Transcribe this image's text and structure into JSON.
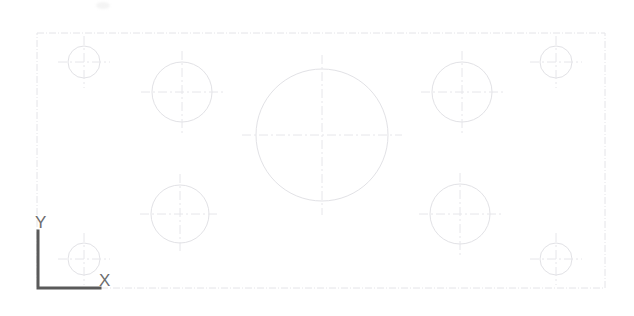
{
  "viewport": {
    "width": 634,
    "height": 316,
    "background_color": "#ffffff",
    "title": "CAD part outline with bolt-hole pattern"
  },
  "colors": {
    "geometry_line": "#e2e2e6",
    "centerline": "#e6e6ea",
    "border_line": "#e4e4e8",
    "ucs_icon": "#5a5a5a",
    "ucs_label": "#6d6d6d",
    "background": "#ffffff"
  },
  "ucs_icon": {
    "name": "ucs-coordinate-icon",
    "origin_x": 38,
    "origin_y": 288,
    "y_arm_top": 231,
    "x_arm_right": 100,
    "stroke_width": 3,
    "y_label": "Y",
    "x_label": "X"
  },
  "part_outline": {
    "name": "rectangular-plate-outline",
    "x": 37,
    "y": 33,
    "width": 568,
    "height": 255,
    "stroke_width": 1
  },
  "chart_data": {
    "type": "scatter",
    "xlabel": "X",
    "ylabel": "Y",
    "xlim": [
      37,
      605
    ],
    "ylim": [
      33,
      288
    ],
    "grid": false,
    "legend": "none",
    "annotations": [
      "Y",
      "X"
    ],
    "series": [
      {
        "name": "corner-holes-small",
        "radius": 16,
        "values": [
          {
            "label": "hole-top-left",
            "cx": 84,
            "cy": 62,
            "r": 16
          },
          {
            "label": "hole-top-right",
            "cx": 556,
            "cy": 62,
            "r": 16
          },
          {
            "label": "hole-bottom-left",
            "cx": 84,
            "cy": 259,
            "r": 16
          },
          {
            "label": "hole-bottom-right",
            "cx": 556,
            "cy": 259,
            "r": 16
          }
        ]
      },
      {
        "name": "intermediate-holes-medium",
        "radius": 30,
        "values": [
          {
            "label": "hole-upper-left",
            "cx": 182,
            "cy": 92,
            "r": 30
          },
          {
            "label": "hole-upper-right",
            "cx": 462,
            "cy": 92,
            "r": 30
          },
          {
            "label": "hole-lower-left",
            "cx": 180,
            "cy": 214,
            "r": 29
          },
          {
            "label": "hole-lower-right",
            "cx": 460,
            "cy": 214,
            "r": 30
          }
        ]
      },
      {
        "name": "central-bore-large",
        "radius": 66,
        "values": [
          {
            "label": "hole-center",
            "cx": 322,
            "cy": 135,
            "r": 66
          }
        ]
      }
    ]
  },
  "circles": [
    {
      "name": "hole-top-left",
      "cx": 84,
      "cy": 62,
      "r": 16,
      "cross": 26
    },
    {
      "name": "hole-top-right",
      "cx": 556,
      "cy": 62,
      "r": 16,
      "cross": 26
    },
    {
      "name": "hole-bottom-left",
      "cx": 84,
      "cy": 259,
      "r": 16,
      "cross": 26
    },
    {
      "name": "hole-bottom-right",
      "cx": 556,
      "cy": 259,
      "r": 16,
      "cross": 26
    },
    {
      "name": "hole-upper-left",
      "cx": 182,
      "cy": 92,
      "r": 30,
      "cross": 41
    },
    {
      "name": "hole-upper-right",
      "cx": 462,
      "cy": 92,
      "r": 30,
      "cross": 41
    },
    {
      "name": "hole-lower-left",
      "cx": 180,
      "cy": 214,
      "r": 29,
      "cross": 40
    },
    {
      "name": "hole-lower-right",
      "cx": 460,
      "cy": 214,
      "r": 30,
      "cross": 41
    },
    {
      "name": "hole-center",
      "cx": 322,
      "cy": 135,
      "r": 66,
      "cross": 80
    }
  ]
}
